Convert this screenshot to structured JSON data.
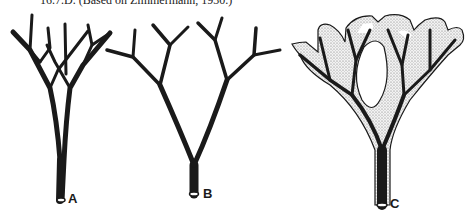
{
  "caption": "16.7.D. (Based on Zimmermann, 1930.)",
  "figures": [
    {
      "id": "A",
      "label": "A",
      "description": "dichotomous branching telome truss with overtopping, unfused branches"
    },
    {
      "id": "B",
      "label": "B",
      "description": "planated dichotomous branching system"
    },
    {
      "id": "C",
      "label": "C",
      "description": "webbed branching system forming a lamina (stippled)"
    }
  ],
  "colors": {
    "stroke": "#1a1a1a",
    "stipple": "#bdbdbd",
    "background": "#ffffff"
  }
}
